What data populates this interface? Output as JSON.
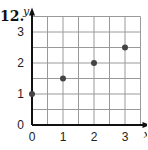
{
  "problem": {
    "number": "12."
  },
  "chart_data": {
    "type": "scatter",
    "title": "",
    "xlabel": "x",
    "ylabel": "y",
    "xlim": [
      0,
      3.5
    ],
    "ylim": [
      0,
      3.5
    ],
    "grid": true,
    "grid_step": 0.5,
    "x_ticks": [
      "0",
      "1",
      "2",
      "3"
    ],
    "y_ticks": [
      "0",
      "1",
      "2",
      "3"
    ],
    "points": [
      {
        "x": 0,
        "y": 1
      },
      {
        "x": 1,
        "y": 1.5
      },
      {
        "x": 2,
        "y": 2
      },
      {
        "x": 3,
        "y": 2.5
      }
    ],
    "colors": {
      "grid": "#9a9a9a",
      "axis": "#111111",
      "point": "#444444"
    }
  }
}
